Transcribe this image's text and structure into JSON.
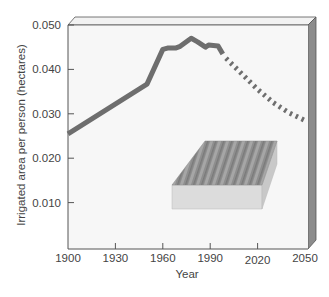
{
  "chart_data": {
    "type": "line",
    "title": "",
    "xlabel": "Year",
    "ylabel": "Irrigated area per person (hectares)",
    "xlim": [
      1900,
      2050
    ],
    "ylim": [
      0,
      0.05
    ],
    "x_ticks": [
      1900,
      1930,
      1960,
      1990,
      2020,
      2050
    ],
    "x_tick_labels": [
      "1900",
      "1930",
      "1960",
      "1990",
      "2020",
      "2050"
    ],
    "y_ticks": [
      0.01,
      0.02,
      0.03,
      0.04,
      0.05
    ],
    "y_tick_labels": [
      "0.010",
      "0.020",
      "0.030",
      "0.040",
      "0.050"
    ],
    "grid": false,
    "legend": null,
    "series": [
      {
        "name": "Historical",
        "style": "solid",
        "color": "#6e6e6e",
        "x": [
          1900,
          1950,
          1960,
          1963,
          1968,
          1971,
          1978,
          1982,
          1987,
          1989,
          1995,
          1998
        ],
        "y": [
          0.0255,
          0.0367,
          0.0445,
          0.0448,
          0.0448,
          0.0452,
          0.047,
          0.0462,
          0.045,
          0.0455,
          0.0453,
          0.0435
        ]
      },
      {
        "name": "Projected",
        "style": "dotted",
        "color": "#6e6e6e",
        "x": [
          2000,
          2010,
          2020,
          2030,
          2040,
          2050
        ],
        "y": [
          0.0425,
          0.039,
          0.0355,
          0.0325,
          0.0302,
          0.0285
        ]
      }
    ],
    "annotations": [
      "3D illustration of a ridged irrigated field block"
    ]
  },
  "colors": {
    "plot_bg": "#f7f7f7",
    "frame": "#555555",
    "side_panel": "#8c8c8c",
    "top_bevel": "#f2f2f2",
    "line": "#6e6e6e",
    "block_top": "#8e8e8e",
    "block_front": "#dcdcdc",
    "block_side": "#c8c8c8"
  }
}
